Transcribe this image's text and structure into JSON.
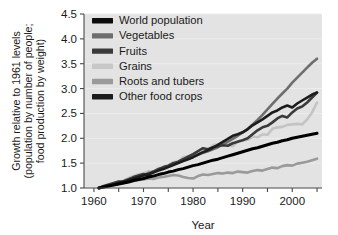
{
  "chart_data": {
    "type": "line",
    "title": "",
    "xlabel": "Year",
    "ylabel": "Growth relative to 1961 levels (population by number of people; food production by weight)",
    "ylabel_lines": [
      "Growth relative to 1961 levels",
      "(population by number of people;",
      "food production by weight)"
    ],
    "xlim": [
      1958,
      2006
    ],
    "ylim": [
      1.0,
      4.5
    ],
    "xticks": [
      1960,
      1970,
      1980,
      1990,
      2000
    ],
    "xtick_labels": [
      "1960",
      "1970",
      "1980",
      "1990",
      "2000"
    ],
    "xticks_minor": [
      1965,
      1975,
      1985,
      1995,
      2005
    ],
    "yticks": [
      1.0,
      1.5,
      2.0,
      2.5,
      3.0,
      3.5,
      4.0,
      4.5
    ],
    "ytick_labels": [
      "1.0",
      "1.5",
      "2.0",
      "2.5",
      "3.0",
      "3.5",
      "4.0",
      "4.5"
    ],
    "grid": false,
    "plot_background": "#e3e3e3",
    "legend_position": "top-left",
    "legend_entries": [
      {
        "label": "World population",
        "color": "#000000",
        "swatch": "#0d0d0d"
      },
      {
        "label": "Vegetables",
        "color": "#6e6e6e",
        "swatch": "#6e6e6e"
      },
      {
        "label": "Fruits",
        "color": "#3a3a3a",
        "swatch": "#3a3a3a"
      },
      {
        "label": "Grains",
        "color": "#c4c4c4",
        "swatch": "#c8c8c8"
      },
      {
        "label": "Roots and tubers",
        "color": "#9a9a9a",
        "swatch": "#9a9a9a"
      },
      {
        "label": "Other food crops",
        "color": "#1c1c1c",
        "swatch": "#1c1c1c"
      }
    ],
    "x": [
      1961,
      1962,
      1963,
      1964,
      1965,
      1966,
      1967,
      1968,
      1969,
      1970,
      1971,
      1972,
      1973,
      1974,
      1975,
      1976,
      1977,
      1978,
      1979,
      1980,
      1981,
      1982,
      1983,
      1984,
      1985,
      1986,
      1987,
      1988,
      1989,
      1990,
      1991,
      1992,
      1993,
      1994,
      1995,
      1996,
      1997,
      1998,
      1999,
      2000,
      2001,
      2002,
      2003,
      2004,
      2005
    ],
    "series": [
      {
        "name": "World population",
        "color": "#000000",
        "width": 3.0,
        "values": [
          1.0,
          1.02,
          1.04,
          1.06,
          1.08,
          1.1,
          1.12,
          1.15,
          1.17,
          1.19,
          1.22,
          1.24,
          1.27,
          1.29,
          1.32,
          1.34,
          1.37,
          1.39,
          1.42,
          1.45,
          1.47,
          1.5,
          1.53,
          1.56,
          1.58,
          1.61,
          1.64,
          1.67,
          1.7,
          1.73,
          1.76,
          1.79,
          1.81,
          1.84,
          1.87,
          1.9,
          1.92,
          1.95,
          1.97,
          2.0,
          2.02,
          2.04,
          2.06,
          2.08,
          2.1
        ]
      },
      {
        "name": "Vegetables",
        "color": "#6e6e6e",
        "width": 2.6,
        "values": [
          1.0,
          1.03,
          1.06,
          1.09,
          1.12,
          1.14,
          1.18,
          1.21,
          1.24,
          1.26,
          1.3,
          1.33,
          1.37,
          1.41,
          1.44,
          1.47,
          1.51,
          1.55,
          1.59,
          1.63,
          1.67,
          1.71,
          1.74,
          1.78,
          1.82,
          1.88,
          1.93,
          1.99,
          2.05,
          2.12,
          2.19,
          2.28,
          2.37,
          2.47,
          2.58,
          2.69,
          2.8,
          2.9,
          3.0,
          3.12,
          3.22,
          3.32,
          3.42,
          3.52,
          3.6
        ]
      },
      {
        "name": "Fruits",
        "color": "#3a3a3a",
        "width": 2.6,
        "values": [
          1.0,
          1.04,
          1.07,
          1.1,
          1.13,
          1.12,
          1.17,
          1.22,
          1.25,
          1.28,
          1.26,
          1.33,
          1.38,
          1.42,
          1.45,
          1.5,
          1.53,
          1.58,
          1.63,
          1.68,
          1.74,
          1.8,
          1.78,
          1.82,
          1.84,
          1.86,
          1.85,
          1.9,
          1.93,
          1.96,
          2.0,
          2.08,
          2.16,
          2.22,
          2.25,
          2.32,
          2.4,
          2.45,
          2.42,
          2.52,
          2.6,
          2.64,
          2.72,
          2.82,
          2.92
        ]
      },
      {
        "name": "Grains",
        "color": "#c4c4c4",
        "width": 2.6,
        "values": [
          1.0,
          1.03,
          1.05,
          1.08,
          1.1,
          1.15,
          1.2,
          1.24,
          1.27,
          1.29,
          1.34,
          1.32,
          1.4,
          1.39,
          1.45,
          1.52,
          1.53,
          1.62,
          1.64,
          1.65,
          1.7,
          1.77,
          1.75,
          1.86,
          1.88,
          1.9,
          1.87,
          1.84,
          1.94,
          1.96,
          1.97,
          2.03,
          2.02,
          2.08,
          2.07,
          2.19,
          2.22,
          2.23,
          2.27,
          2.28,
          2.29,
          2.28,
          2.38,
          2.52,
          2.72
        ]
      },
      {
        "name": "Roots and tubers",
        "color": "#9a9a9a",
        "width": 2.6,
        "values": [
          1.0,
          1.02,
          1.04,
          1.06,
          1.08,
          1.1,
          1.13,
          1.14,
          1.16,
          1.17,
          1.19,
          1.18,
          1.21,
          1.22,
          1.24,
          1.26,
          1.25,
          1.22,
          1.2,
          1.19,
          1.24,
          1.27,
          1.26,
          1.28,
          1.3,
          1.29,
          1.31,
          1.3,
          1.33,
          1.32,
          1.31,
          1.34,
          1.36,
          1.35,
          1.38,
          1.41,
          1.4,
          1.44,
          1.46,
          1.45,
          1.49,
          1.51,
          1.53,
          1.56,
          1.59
        ]
      },
      {
        "name": "Other food crops",
        "color": "#1c1c1c",
        "width": 2.6,
        "values": [
          1.0,
          1.03,
          1.05,
          1.07,
          1.1,
          1.13,
          1.16,
          1.19,
          1.22,
          1.25,
          1.28,
          1.31,
          1.35,
          1.38,
          1.42,
          1.46,
          1.5,
          1.54,
          1.58,
          1.62,
          1.67,
          1.72,
          1.76,
          1.81,
          1.87,
          1.93,
          1.99,
          2.05,
          2.08,
          2.12,
          2.18,
          2.26,
          2.32,
          2.38,
          2.45,
          2.52,
          2.56,
          2.62,
          2.66,
          2.62,
          2.7,
          2.76,
          2.82,
          2.88,
          2.92
        ]
      }
    ]
  }
}
